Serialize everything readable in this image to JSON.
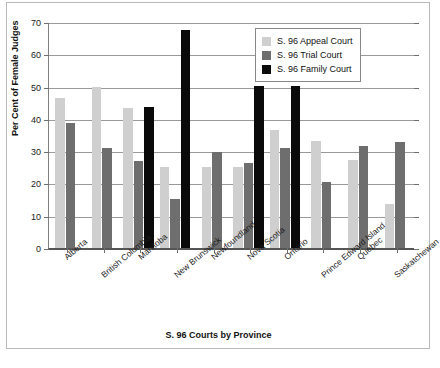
{
  "chart_data": {
    "type": "bar",
    "title": "",
    "xlabel": "S. 96 Courts by Province",
    "ylabel": "Per Cent of Female Judges",
    "ylim": [
      0,
      70
    ],
    "yticks": [
      0,
      10,
      20,
      30,
      40,
      50,
      60,
      70
    ],
    "grid": true,
    "legend_position": "top-right",
    "categories": [
      "Alberta",
      "British Columbia",
      "Manitoba",
      "New Brunswick",
      "Newfoundland",
      "Nova Scotia",
      "Ontario",
      "Prince Edward Island",
      "Quebec",
      "Saskatchewan"
    ],
    "series": [
      {
        "name": "S. 96 Appeal Court",
        "color": "#cfcfcf",
        "values": [
          46.5,
          50.0,
          43.4,
          25.2,
          25.2,
          25.2,
          36.7,
          33.3,
          27.3,
          13.5
        ]
      },
      {
        "name": "S. 96 Trial Court",
        "color": "#6e6e6e",
        "values": [
          38.8,
          30.9,
          26.8,
          15.1,
          29.6,
          26.3,
          31.0,
          20.5,
          31.7,
          32.7
        ]
      },
      {
        "name": "S. 96 Family Court",
        "color": "#0a0a0a",
        "values": [
          null,
          null,
          43.7,
          67.5,
          null,
          50.2,
          50.2,
          null,
          null,
          null
        ]
      }
    ]
  },
  "legend": {
    "items": [
      {
        "label": "S. 96 Appeal Court",
        "color": "#cfcfcf"
      },
      {
        "label": "S. 96 Trial Court",
        "color": "#6e6e6e"
      },
      {
        "label": "S. 96 Family Court",
        "color": "#0a0a0a"
      }
    ]
  },
  "axes": {
    "y_title": "Per Cent of Female Judges",
    "x_title": "S. 96 Courts by Province",
    "y_tick_labels": [
      "0",
      "10",
      "20",
      "30",
      "40",
      "50",
      "60",
      "70"
    ]
  }
}
